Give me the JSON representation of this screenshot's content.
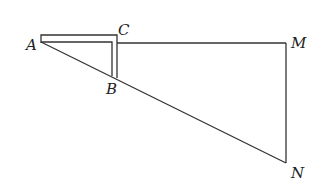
{
  "diagram": {
    "type": "geometry",
    "points": {
      "A": {
        "label": "A",
        "x": 41,
        "y": 39
      },
      "B": {
        "label": "B",
        "x": 115,
        "y": 78
      },
      "C": {
        "label": "C",
        "x": 117,
        "y": 36
      },
      "M": {
        "label": "M",
        "x": 286,
        "y": 43
      },
      "N": {
        "label": "N",
        "x": 286,
        "y": 163
      }
    },
    "segments": [
      {
        "from": "C",
        "to": "M"
      },
      {
        "from": "M",
        "to": "N"
      },
      {
        "from": "A",
        "to": "N"
      }
    ],
    "labels": {
      "A": "A",
      "B": "B",
      "C": "C",
      "M": "M",
      "N": "N"
    },
    "colors": {
      "stroke": "#333333",
      "background": "#ffffff"
    }
  }
}
